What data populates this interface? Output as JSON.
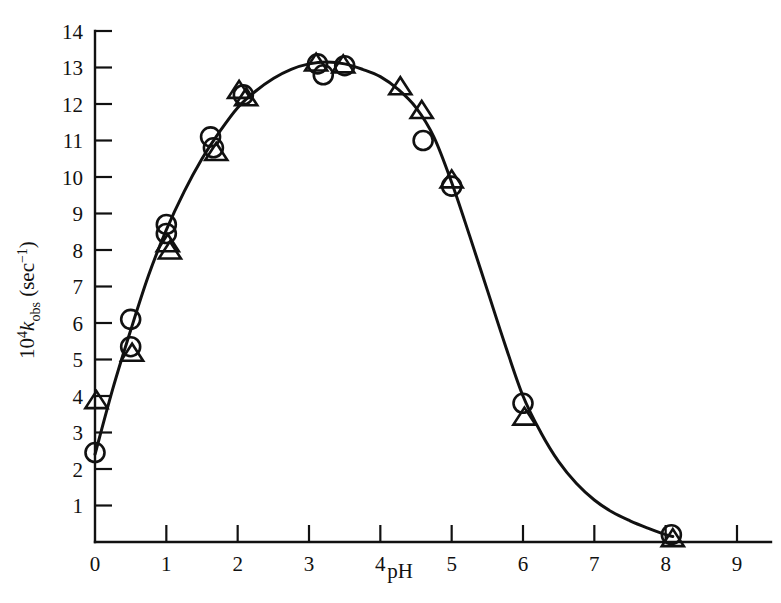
{
  "figure": {
    "background_color": "#ffffff",
    "ink_color": "#111111"
  },
  "chart_data": {
    "type": "scatter",
    "title": "",
    "subtitle": "",
    "xlabel": "pH",
    "ylabel_parts": {
      "prefix": "10",
      "prefix_exponent": "4",
      "symbol": "k",
      "subscript": "obs",
      "units": " (sec",
      "units_exponent": "−1",
      "units_close": ")"
    },
    "ylabel": "10⁴k_obs (sec⁻¹)",
    "xlim": [
      0,
      9
    ],
    "ylim": [
      0,
      14
    ],
    "xticks": [
      0,
      1,
      2,
      3,
      4,
      5,
      6,
      7,
      8,
      9
    ],
    "xtick_labels": [
      "0",
      "1",
      "2",
      "3",
      "4",
      "5",
      "6",
      "7",
      "8",
      "9"
    ],
    "yticks": [
      1,
      2,
      3,
      4,
      5,
      6,
      7,
      8,
      9,
      10,
      11,
      12,
      13,
      14
    ],
    "ytick_labels": [
      "1",
      "2",
      "3",
      "4",
      "5",
      "6",
      "7",
      "8",
      "9",
      "10",
      "11",
      "12",
      "13",
      "14"
    ],
    "grid": false,
    "legend": null,
    "legend_position": "none",
    "tick_direction": "in",
    "axis_style": "left-and-bottom-spines",
    "series": [
      {
        "name": "circle-series",
        "marker": "circle",
        "points": [
          {
            "x": 0.0,
            "y": 2.45
          },
          {
            "x": 0.5,
            "y": 6.1
          },
          {
            "x": 0.5,
            "y": 5.35
          },
          {
            "x": 1.0,
            "y": 8.7
          },
          {
            "x": 1.0,
            "y": 8.45
          },
          {
            "x": 1.62,
            "y": 11.1
          },
          {
            "x": 1.66,
            "y": 10.8
          },
          {
            "x": 2.08,
            "y": 12.25
          },
          {
            "x": 3.12,
            "y": 13.1
          },
          {
            "x": 3.2,
            "y": 12.8
          },
          {
            "x": 3.5,
            "y": 13.05
          },
          {
            "x": 4.6,
            "y": 11.0
          },
          {
            "x": 5.0,
            "y": 9.75
          },
          {
            "x": 6.0,
            "y": 3.8
          },
          {
            "x": 8.08,
            "y": 0.2
          }
        ]
      },
      {
        "name": "triangle-series",
        "marker": "triangle",
        "points": [
          {
            "x": 0.02,
            "y": 3.9
          },
          {
            "x": 0.52,
            "y": 5.2
          },
          {
            "x": 1.02,
            "y": 8.2
          },
          {
            "x": 1.05,
            "y": 8.0
          },
          {
            "x": 1.7,
            "y": 10.7
          },
          {
            "x": 2.02,
            "y": 12.4
          },
          {
            "x": 2.12,
            "y": 12.2
          },
          {
            "x": 3.1,
            "y": 13.15
          },
          {
            "x": 3.48,
            "y": 13.1
          },
          {
            "x": 4.28,
            "y": 12.5
          },
          {
            "x": 4.58,
            "y": 11.85
          },
          {
            "x": 5.0,
            "y": 9.95
          },
          {
            "x": 6.02,
            "y": 3.45
          },
          {
            "x": 8.1,
            "y": 0.12
          }
        ]
      }
    ],
    "fitted_curve": {
      "name": "bell-shaped-fit",
      "description": "Smooth bell-shaped pH-rate profile peaking near pH 3.3",
      "points": [
        {
          "x": 0.0,
          "y": 2.4
        },
        {
          "x": 0.25,
          "y": 4.2
        },
        {
          "x": 0.5,
          "y": 5.8
        },
        {
          "x": 0.75,
          "y": 7.3
        },
        {
          "x": 1.0,
          "y": 8.55
        },
        {
          "x": 1.25,
          "y": 9.6
        },
        {
          "x": 1.5,
          "y": 10.5
        },
        {
          "x": 1.75,
          "y": 11.25
        },
        {
          "x": 2.0,
          "y": 11.9
        },
        {
          "x": 2.25,
          "y": 12.35
        },
        {
          "x": 2.5,
          "y": 12.7
        },
        {
          "x": 2.75,
          "y": 12.95
        },
        {
          "x": 3.0,
          "y": 13.1
        },
        {
          "x": 3.25,
          "y": 13.15
        },
        {
          "x": 3.5,
          "y": 13.1
        },
        {
          "x": 3.75,
          "y": 12.95
        },
        {
          "x": 4.0,
          "y": 12.75
        },
        {
          "x": 4.25,
          "y": 12.4
        },
        {
          "x": 4.5,
          "y": 11.9
        },
        {
          "x": 4.75,
          "y": 11.1
        },
        {
          "x": 5.0,
          "y": 9.85
        },
        {
          "x": 5.25,
          "y": 8.4
        },
        {
          "x": 5.5,
          "y": 6.9
        },
        {
          "x": 5.75,
          "y": 5.4
        },
        {
          "x": 6.0,
          "y": 4.0
        },
        {
          "x": 6.25,
          "y": 3.0
        },
        {
          "x": 6.5,
          "y": 2.2
        },
        {
          "x": 6.75,
          "y": 1.6
        },
        {
          "x": 7.0,
          "y": 1.15
        },
        {
          "x": 7.25,
          "y": 0.82
        },
        {
          "x": 7.5,
          "y": 0.58
        },
        {
          "x": 7.75,
          "y": 0.38
        },
        {
          "x": 8.0,
          "y": 0.2
        },
        {
          "x": 8.1,
          "y": 0.15
        }
      ]
    }
  }
}
